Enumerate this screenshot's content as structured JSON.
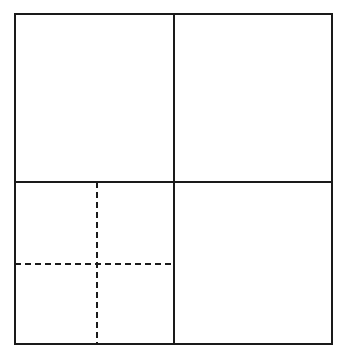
{
  "figure": {
    "canvas": {
      "width": 350,
      "height": 360
    },
    "background_color": "#ffffff",
    "styles": {
      "solid_line_color": "#1a1a1a",
      "solid_line_width": 1.8,
      "dashed_line_color": "#1a1a1a",
      "dashed_line_width": 1.8,
      "dash_pattern": "6 4"
    },
    "outer_square": {
      "label": "outer boundary square",
      "x1": 15,
      "y1": 14,
      "x2": 332,
      "y2": 344,
      "line_style": "solid"
    },
    "solid_dividers": [
      {
        "label": "vertical divider",
        "orientation": "vertical",
        "x1": 174,
        "y1": 14,
        "x2": 174,
        "y2": 344,
        "line_style": "solid"
      },
      {
        "label": "horizontal divider",
        "orientation": "horizontal",
        "x1": 15,
        "y1": 182,
        "x2": 332,
        "y2": 182,
        "line_style": "solid"
      }
    ],
    "dashed_dividers": [
      {
        "label": "sub-quadrant vertical divider",
        "orientation": "vertical",
        "x1": 97,
        "y1": 182,
        "x2": 97,
        "y2": 344,
        "line_style": "dashed"
      },
      {
        "label": "sub-quadrant horizontal divider",
        "orientation": "horizontal",
        "x1": 15,
        "y1": 264,
        "x2": 174,
        "y2": 264,
        "line_style": "dashed"
      }
    ],
    "quadrants": [
      {
        "name": "top-left-quadrant",
        "x": 15,
        "y": 14,
        "width": 159,
        "height": 168,
        "subdivided": false
      },
      {
        "name": "top-right-quadrant",
        "x": 174,
        "y": 14,
        "width": 158,
        "height": 168,
        "subdivided": false
      },
      {
        "name": "bottom-left-quadrant",
        "x": 15,
        "y": 182,
        "width": 159,
        "height": 162,
        "subdivided": true
      },
      {
        "name": "bottom-right-quadrant",
        "x": 174,
        "y": 182,
        "width": 158,
        "height": 162,
        "subdivided": false
      }
    ],
    "sub_quadrants": [
      {
        "name": "sub-quadrant-top-left",
        "x": 15,
        "y": 182,
        "width": 82,
        "height": 82
      },
      {
        "name": "sub-quadrant-top-right",
        "x": 97,
        "y": 182,
        "width": 77,
        "height": 82
      },
      {
        "name": "sub-quadrant-bottom-left",
        "x": 15,
        "y": 264,
        "width": 82,
        "height": 80
      },
      {
        "name": "sub-quadrant-bottom-right",
        "x": 97,
        "y": 264,
        "width": 77,
        "height": 80
      }
    ]
  }
}
